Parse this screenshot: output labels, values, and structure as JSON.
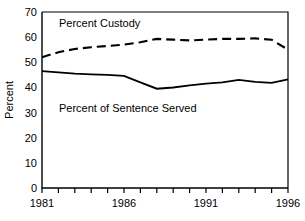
{
  "chart_data": {
    "type": "line",
    "title": "",
    "xlabel": "",
    "ylabel": "Percent",
    "xlim": [
      1981,
      1996
    ],
    "ylim": [
      0,
      70
    ],
    "grid": false,
    "legend_position": "inline-annotations",
    "x": [
      1981,
      1982,
      1983,
      1984,
      1985,
      1986,
      1987,
      1988,
      1989,
      1990,
      1991,
      1992,
      1993,
      1994,
      1995,
      1996
    ],
    "x_tick_labels": [
      "1981",
      "1986",
      "1991",
      "1996"
    ],
    "x_tick_values": [
      1981,
      1986,
      1991,
      1996
    ],
    "x_minor_ticks": [
      1982,
      1983,
      1984,
      1985,
      1987,
      1988,
      1989,
      1990,
      1992,
      1993,
      1994,
      1995
    ],
    "y_tick_labels": [
      "0",
      "10",
      "20",
      "30",
      "40",
      "50",
      "60",
      "70"
    ],
    "y_tick_values": [
      0,
      10,
      20,
      30,
      40,
      50,
      60,
      70
    ],
    "series": [
      {
        "name": "Percent Custody",
        "style": "dashed",
        "color": "#000000",
        "annotation": "Percent Custody",
        "values": [
          52.0,
          54.0,
          55.3,
          56.0,
          56.5,
          57.0,
          58.0,
          59.3,
          59.0,
          58.7,
          59.0,
          59.3,
          59.3,
          59.5,
          59.0,
          55.0
        ]
      },
      {
        "name": "Percent of Sentence Served",
        "style": "solid",
        "color": "#000000",
        "annotation": "Percent of Sentence Served",
        "values": [
          46.5,
          46.0,
          45.5,
          45.2,
          45.0,
          44.6,
          42.0,
          39.5,
          40.0,
          40.8,
          41.5,
          42.0,
          43.0,
          42.2,
          41.8,
          43.2
        ]
      }
    ],
    "annotations": [
      {
        "text": "Percent Custody",
        "x_px": 59,
        "y_px": 27
      },
      {
        "text": "Percent of Sentence Served",
        "x_px": 59,
        "y_px": 112
      }
    ]
  },
  "axis": {
    "y_title": "Percent"
  }
}
